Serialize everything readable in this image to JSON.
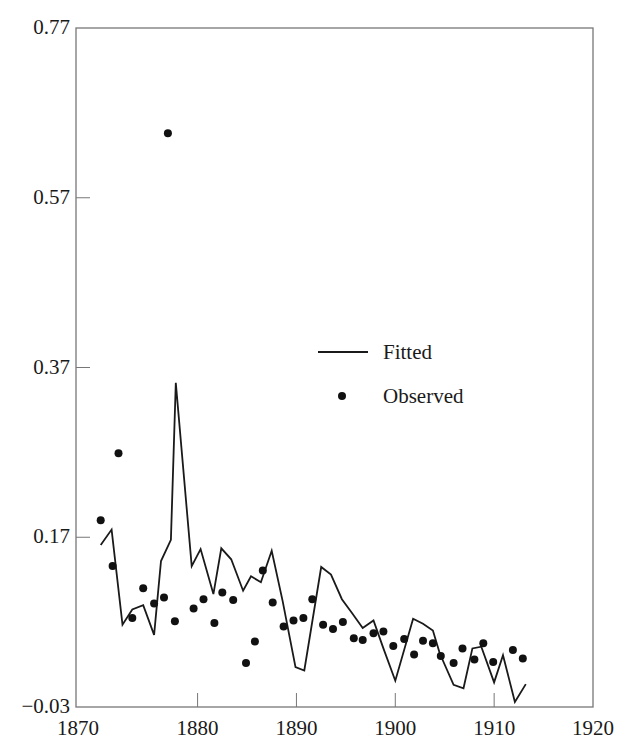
{
  "chart_data": {
    "type": "line",
    "title": "",
    "xlabel": "",
    "ylabel": "",
    "xlim": [
      1867.7,
      1920
    ],
    "ylim": [
      -0.03,
      0.77
    ],
    "grid": false,
    "legend_position": "center-right (inside plot)",
    "x_ticks": [
      1870,
      1880,
      1890,
      1900,
      1910,
      1920
    ],
    "x_tick_labels": [
      "1870",
      "1880",
      "1890",
      "1900",
      "1910",
      "1920"
    ],
    "y_ticks": [
      -0.03,
      0.17,
      0.37,
      0.57,
      0.77
    ],
    "y_tick_labels": [
      "−0.03",
      "0.17",
      "0.37",
      "0.57",
      "0.77"
    ],
    "legend": [
      "Fitted",
      "Observed"
    ],
    "series": [
      {
        "name": "Fitted",
        "style": "line",
        "color": "#1a1a1a",
        "x": [
          1870.2,
          1871.3,
          1872.4,
          1873.4,
          1874.5,
          1875.6,
          1876.3,
          1877.3,
          1877.8,
          1879.4,
          1880.3,
          1881.6,
          1882.4,
          1883.4,
          1884.6,
          1885.4,
          1886.4,
          1887.5,
          1888.6,
          1889.9,
          1890.8,
          1892.5,
          1893.5,
          1894.6,
          1895.6,
          1896.7,
          1897.8,
          1898.8,
          1900.0,
          1901.8,
          1902.8,
          1903.8,
          1904.5,
          1905.9,
          1906.9,
          1907.8,
          1908.7,
          1910.0,
          1910.9,
          1912.1,
          1913.2
        ],
        "y": [
          0.161,
          0.179,
          0.067,
          0.085,
          0.09,
          0.055,
          0.142,
          0.167,
          0.352,
          0.136,
          0.156,
          0.103,
          0.157,
          0.144,
          0.107,
          0.124,
          0.117,
          0.154,
          0.095,
          0.017,
          0.013,
          0.135,
          0.126,
          0.097,
          0.081,
          0.063,
          0.072,
          0.039,
          0.001,
          0.074,
          0.068,
          0.06,
          0.033,
          -0.004,
          -0.008,
          0.039,
          0.041,
          -0.001,
          0.031,
          -0.024,
          -0.003
        ]
      },
      {
        "name": "Observed",
        "style": "scatter",
        "color": "#111111",
        "x": [
          1870.2,
          1871.4,
          1872.0,
          1873.4,
          1874.5,
          1875.6,
          1876.6,
          1877.0,
          1877.7,
          1879.6,
          1880.6,
          1881.7,
          1882.5,
          1883.6,
          1884.9,
          1885.8,
          1886.6,
          1887.6,
          1888.7,
          1889.7,
          1890.7,
          1891.6,
          1892.7,
          1893.7,
          1894.7,
          1895.8,
          1896.7,
          1897.8,
          1898.8,
          1899.8,
          1900.9,
          1901.9,
          1902.8,
          1903.8,
          1904.6,
          1905.9,
          1906.8,
          1908.0,
          1908.9,
          1909.9,
          1911.9,
          1912.9
        ],
        "y": [
          0.19,
          0.136,
          0.269,
          0.075,
          0.11,
          0.092,
          0.099,
          0.646,
          0.071,
          0.086,
          0.097,
          0.069,
          0.105,
          0.096,
          0.022,
          0.047,
          0.131,
          0.093,
          0.065,
          0.072,
          0.075,
          0.097,
          0.067,
          0.062,
          0.07,
          0.051,
          0.049,
          0.057,
          0.059,
          0.042,
          0.05,
          0.032,
          0.048,
          0.045,
          0.03,
          0.022,
          0.039,
          0.026,
          0.045,
          0.023,
          0.037,
          0.027
        ]
      }
    ]
  },
  "legend": {
    "fitted_label": "Fitted",
    "observed_label": "Observed"
  },
  "colors": {
    "axis": "#777777",
    "line": "#1a1a1a",
    "marker": "#111111",
    "text": "#1a1a1a"
  }
}
